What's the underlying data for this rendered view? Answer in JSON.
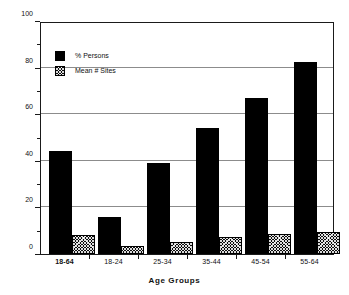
{
  "chart_data": {
    "type": "bar",
    "title": "",
    "xlabel": "Age  Groups",
    "ylabel": "",
    "ylim": [
      0,
      100
    ],
    "yticks": [
      0,
      20,
      40,
      60,
      80,
      100
    ],
    "ytick_labels": [
      "0",
      "20",
      "40",
      "60",
      "80",
      "100"
    ],
    "grid": true,
    "grid_axis": "y",
    "legend_position": "upper-left-inside",
    "categories": [
      "18-64",
      "18-24",
      "25-34",
      "35-44",
      "45-54",
      "55-64"
    ],
    "series": [
      {
        "name": "% Persons",
        "fill": "solid-black",
        "color": "#000000",
        "values": [
          44,
          16,
          39,
          54,
          67,
          82.5
        ]
      },
      {
        "name": "Mean # Sites",
        "fill": "cross-hatch",
        "color": "#0d0d0d",
        "values": [
          8,
          3.5,
          5,
          7.5,
          8.5,
          9.5
        ]
      }
    ]
  },
  "axes": {
    "x_title": "Age  Groups",
    "x_categories": [
      {
        "label": "18-64",
        "emphasis": true
      },
      {
        "label": "18-24",
        "emphasis": false
      },
      {
        "label": "25-34",
        "emphasis": false
      },
      {
        "label": "35-44",
        "emphasis": false
      },
      {
        "label": "45-54",
        "emphasis": false
      },
      {
        "label": "55-64",
        "emphasis": false
      }
    ],
    "y_labels": [
      "100",
      "80",
      "60",
      "40",
      "20",
      "0"
    ]
  },
  "legend": {
    "items": [
      {
        "label": "% Persons",
        "fill": "solid"
      },
      {
        "label": "Mean # Sites",
        "fill": "hatch"
      }
    ]
  },
  "colors": {
    "series_solid": "#000000",
    "series_hatch": "#0d0d0d",
    "gridline": "#8c8c8c",
    "frame": "#1a1a1a",
    "background": "#ffffff",
    "text": "#111111"
  }
}
